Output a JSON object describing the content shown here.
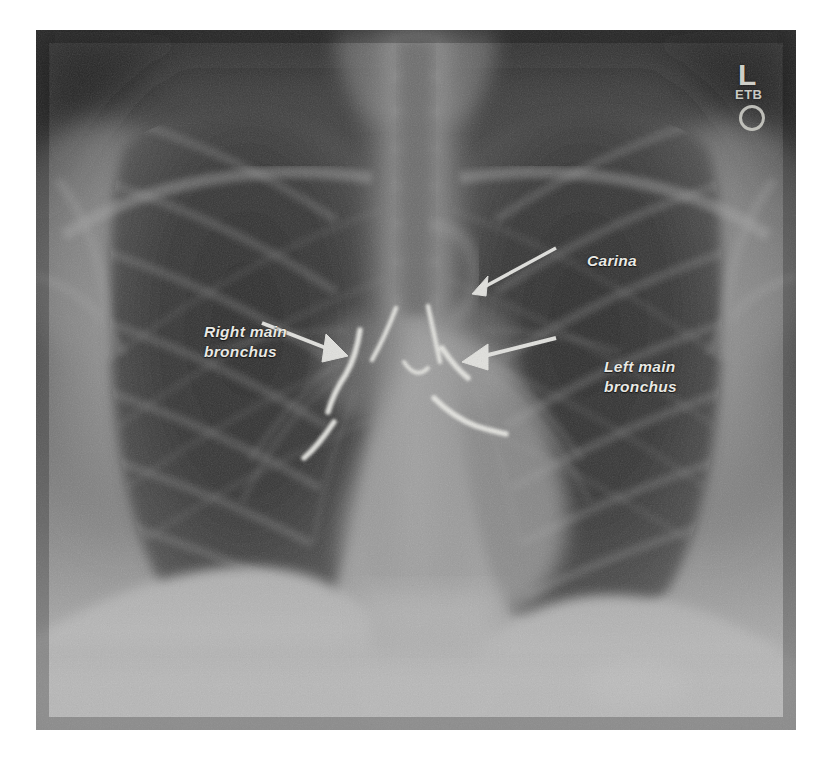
{
  "image": {
    "kind": "chest-radiograph",
    "view": "frontal PA chest x-ray",
    "width": 828,
    "height": 760,
    "plate": {
      "left": 36,
      "top": 30,
      "width": 760,
      "height": 700
    },
    "page_background": "#ffffff",
    "plate_background": "#3a3a3a"
  },
  "annotations": {
    "text_color": "#e9e9e4",
    "line_color": "#f2f2ee",
    "items": [
      {
        "id": "right-main-bronchus",
        "line1": "Right main",
        "line2": "bronchus",
        "x": 168,
        "y": 292,
        "arrow_from": [
          262,
          322
        ],
        "arrow_to": [
          342,
          356
        ]
      },
      {
        "id": "carina",
        "line1": "Carina",
        "line2": "",
        "x": 551,
        "y": 221,
        "arrow_from": [
          548,
          248
        ],
        "arrow_to": [
          473,
          286
        ]
      },
      {
        "id": "left-main-bronchus",
        "line1": "Left main",
        "line2": "bronchus",
        "x": 568,
        "y": 327,
        "arrow_from": [
          551,
          344
        ],
        "arrow_to": [
          463,
          364
        ]
      }
    ]
  },
  "side_marker": {
    "laterality": "L",
    "initials": "ETB",
    "shape": "ring",
    "color": "#cfcfc8"
  },
  "traced_airways": {
    "stroke_color": "#f5f5f0",
    "description": "hand-traced white outlines of the trachea bifurcation, right and left main bronchi"
  }
}
